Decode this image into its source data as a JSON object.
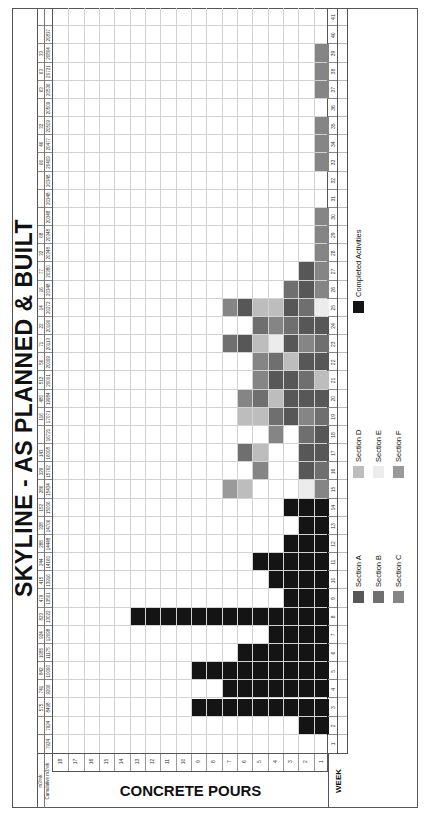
{
  "title": "SKYLINE - AS PLANNED & BUILT",
  "y_axis_label": "CONCRETE POURS",
  "x_axis_label": "WEEK",
  "header_rows": {
    "m3_label": "m3/wk",
    "cumulative_label": "Cumulative m3/wk",
    "m3_per_week": [
      "",
      "",
      "575",
      "741",
      "842",
      "1085",
      "924",
      "823",
      "479",
      "415",
      "244",
      "288",
      "328",
      "152",
      "286",
      "329",
      "143",
      "",
      "116",
      "480",
      "512",
      "56",
      "71",
      "22",
      "14",
      "16",
      "77",
      "32",
      "68",
      "",
      "",
      "",
      "66",
      "46",
      "32",
      "",
      "63",
      "63",
      "33",
      "",
      ""
    ],
    "cumulative": [
      "7924",
      "7924",
      "8498",
      "9206",
      "10090",
      "11175",
      "12098",
      "13022",
      "13501",
      "13916",
      "14160",
      "14448",
      "14706",
      "15006",
      "15434",
      "15762",
      "16008",
      "16721",
      "17071",
      "19984",
      "20001",
      "20099",
      "20113",
      "20190",
      "20272",
      "20348",
      "20380",
      "20348",
      "20348",
      "20348",
      "20348",
      "20348",
      "20409",
      "20477",
      "20509",
      "20509",
      "20536",
      "20721",
      "20804",
      "20837",
      ""
    ]
  },
  "colors": {
    "completed": "#141414",
    "A": "#575757",
    "B": "#6f6f6f",
    "C": "#858585",
    "D": "#bdbdbd",
    "E": "#ececec",
    "F": "#9a9a9a",
    "grid": "#d2d2d2",
    "border": "#555555"
  },
  "legend": [
    {
      "key": "A",
      "label": "Section A"
    },
    {
      "key": "B",
      "label": "Section B"
    },
    {
      "key": "C",
      "label": "Section C"
    },
    {
      "key": "D",
      "label": "Section D"
    },
    {
      "key": "E",
      "label": "Section E"
    },
    {
      "key": "F",
      "label": "Section F"
    },
    {
      "key": "completed",
      "label": "Completed Activities"
    }
  ],
  "chart_data": {
    "type": "heatmap",
    "title": "SKYLINE - AS PLANNED & BUILT",
    "xlabel": "WEEK",
    "ylabel": "CONCRETE POURS",
    "x": [
      1,
      2,
      3,
      4,
      5,
      6,
      7,
      8,
      9,
      10,
      11,
      12,
      13,
      14,
      15,
      16,
      17,
      18,
      19,
      20,
      21,
      22,
      23,
      24,
      25,
      26,
      27,
      28,
      29,
      30,
      31,
      32,
      33,
      34,
      35,
      36,
      37,
      38,
      39,
      40,
      41
    ],
    "y_ticks": [
      1,
      2,
      3,
      4,
      5,
      6,
      7,
      8,
      9,
      10,
      11,
      12,
      13,
      14,
      15,
      16,
      17,
      18
    ],
    "ylim": [
      0,
      18
    ],
    "grid": true,
    "legend_position": "bottom",
    "pours_per_week": [
      0,
      2,
      9,
      7,
      9,
      6,
      4,
      13,
      3,
      4,
      5,
      3,
      2,
      3,
      7,
      5,
      6,
      4,
      6,
      6,
      5,
      5,
      7,
      5,
      7,
      3,
      2,
      1,
      1,
      1,
      0,
      0,
      1,
      1,
      1,
      0,
      1,
      1,
      1,
      0,
      0
    ],
    "cells_by_week": {
      "2": [
        "X",
        "X"
      ],
      "3": [
        "X",
        "X",
        "X",
        "X",
        "X",
        "X",
        "X",
        "X",
        "X"
      ],
      "4": [
        "X",
        "X",
        "X",
        "X",
        "X",
        "X",
        "X"
      ],
      "5": [
        "X",
        "X",
        "X",
        "X",
        "X",
        "X",
        "X",
        "X",
        "X"
      ],
      "6": [
        "X",
        "X",
        "X",
        "X",
        "X",
        "X"
      ],
      "7": [
        "X",
        "X",
        "X",
        "X"
      ],
      "8": [
        "X",
        "X",
        "X",
        "X",
        "X",
        "X",
        "X",
        "X",
        "X",
        "X",
        "X",
        "X",
        "X"
      ],
      "9": [
        "X",
        "X",
        "X"
      ],
      "10": [
        "X",
        "X",
        "X",
        "X"
      ],
      "11": [
        "X",
        "X",
        "X",
        "X",
        "X"
      ],
      "12": [
        "X",
        "X",
        "X"
      ],
      "13": [
        "X",
        "X"
      ],
      "14": [
        "X",
        "X",
        "X"
      ],
      "15": [
        "C",
        "E",
        "",
        "",
        "",
        "D",
        "F"
      ],
      "16": [
        "B",
        "A",
        "",
        "",
        "C"
      ],
      "17": [
        "A",
        "A",
        "",
        "",
        "D",
        "B"
      ],
      "18": [
        "A",
        "B",
        "",
        "C"
      ],
      "19": [
        "B",
        "C",
        "A",
        "B",
        "D",
        "D"
      ],
      "20": [
        "A",
        "A",
        "A",
        "D",
        "B",
        "C"
      ],
      "21": [
        "D",
        "B",
        "A",
        "A",
        "C"
      ],
      "22": [
        "A",
        "A",
        "D",
        "B",
        "C"
      ],
      "23": [
        "B",
        "C",
        "A",
        "E",
        "D",
        "A",
        "B"
      ],
      "24": [
        "A",
        "A",
        "B",
        "C",
        "B"
      ],
      "25": [
        "E",
        "B",
        "A",
        "D",
        "D",
        "A",
        "C"
      ],
      "26": [
        "C",
        "A",
        "B"
      ],
      "27": [
        "C",
        "A"
      ],
      "28": [
        "C"
      ],
      "29": [
        "C"
      ],
      "30": [
        "C"
      ],
      "33": [
        "C"
      ],
      "34": [
        "C"
      ],
      "35": [
        "C"
      ],
      "37": [
        "C"
      ],
      "38": [
        "C"
      ],
      "39": [
        "C"
      ]
    },
    "cell_key": {
      "X": "Completed Activities",
      "A": "Section A",
      "B": "Section B",
      "C": "Section C",
      "D": "Section D",
      "E": "Section E",
      "F": "Section F"
    }
  }
}
